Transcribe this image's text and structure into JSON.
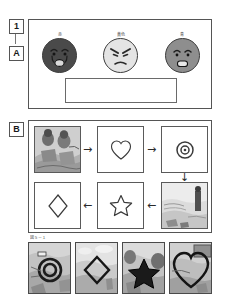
{
  "page": {
    "background": "#ffffff",
    "ink": "#2a2a2a",
    "border_color": "#555555"
  },
  "markers": [
    {
      "id": "question-number",
      "label": "1"
    },
    {
      "id": "section-a",
      "label": "A"
    },
    {
      "id": "section-b",
      "label": "B"
    }
  ],
  "section_a": {
    "faces": [
      {
        "name": "sad-face",
        "label": "赤",
        "expression": "sad",
        "fill": "#4a4a4a"
      },
      {
        "name": "angry-face",
        "label": "黄色",
        "expression": "angry",
        "fill": "#e4e4e4"
      },
      {
        "name": "happy-face",
        "label": "青",
        "expression": "happy",
        "fill": "#8e8e8e"
      }
    ],
    "answer_box": {
      "value": "",
      "placeholder": ""
    }
  },
  "section_b": {
    "cells": [
      {
        "pos": "r1c1",
        "type": "photo",
        "caption": "scene-figures-outdoors"
      },
      {
        "pos": "r1c2",
        "type": "shape",
        "shape": "heart"
      },
      {
        "pos": "r1c3",
        "type": "shape",
        "shape": "target"
      },
      {
        "pos": "r2c1",
        "type": "shape",
        "shape": "diamond"
      },
      {
        "pos": "r2c2",
        "type": "shape",
        "shape": "star"
      },
      {
        "pos": "r2c3",
        "type": "photo",
        "caption": "scene-figure-standing"
      }
    ],
    "arrows": [
      {
        "id": "arrow-r1c1-to-r1c2",
        "glyph": "→",
        "direction": "right"
      },
      {
        "id": "arrow-r1c2-to-r1c3",
        "glyph": "→",
        "direction": "right"
      },
      {
        "id": "arrow-r1c3-to-r2c3",
        "glyph": "↓",
        "direction": "down"
      },
      {
        "id": "arrow-r2c3-to-r2c2",
        "glyph": "←",
        "direction": "left"
      },
      {
        "id": "arrow-r2c2-to-r2c1",
        "glyph": "←",
        "direction": "left"
      }
    ]
  },
  "filmstrip": {
    "caption": "図５－１",
    "thumbs": [
      {
        "name": "thumb-target",
        "shape": "target"
      },
      {
        "name": "thumb-diamond",
        "shape": "diamond"
      },
      {
        "name": "thumb-star",
        "shape": "star"
      },
      {
        "name": "thumb-heart",
        "shape": "heart"
      }
    ]
  }
}
